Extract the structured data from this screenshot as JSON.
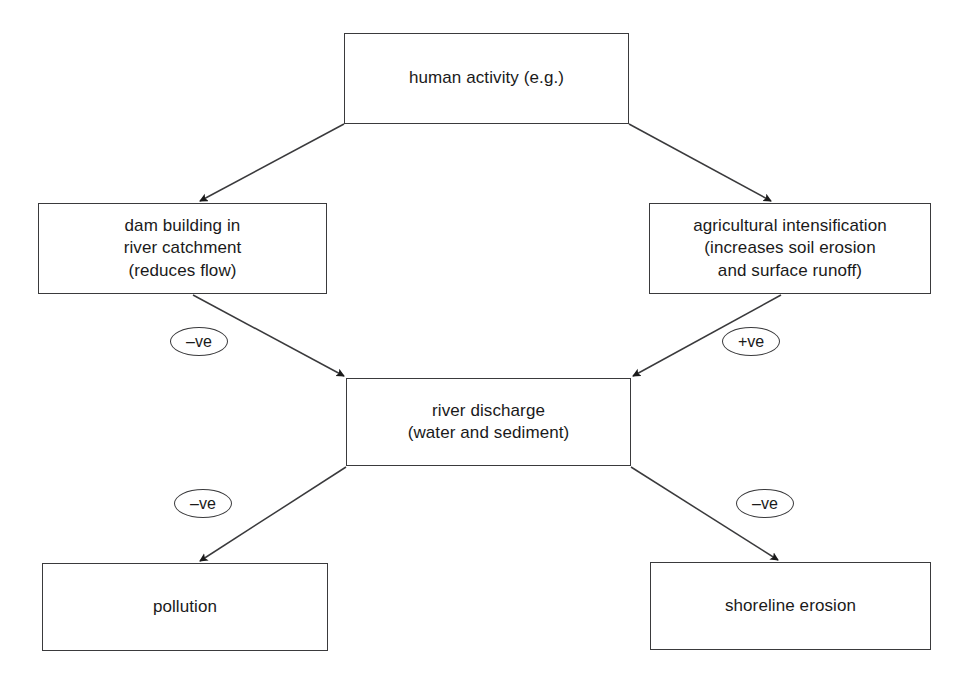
{
  "diagram": {
    "type": "flow-diagram",
    "canvas": {
      "width": 979,
      "height": 679,
      "background": "#ffffff"
    },
    "stroke_color": "#3a3a3c",
    "text_color": "#1a1a1a",
    "nodes": [
      {
        "id": "human-activity",
        "label": "human activity (e.g.)",
        "x": 344,
        "y": 33,
        "width": 285,
        "height": 91
      },
      {
        "id": "dam-building",
        "label": "dam building in\nriver catchment\n(reduces flow)",
        "x": 38,
        "y": 203,
        "width": 289,
        "height": 91
      },
      {
        "id": "agricultural-intensification",
        "label": "agricultural intensification\n(increases soil erosion\nand surface runoff)",
        "x": 649,
        "y": 203,
        "width": 282,
        "height": 91
      },
      {
        "id": "river-discharge",
        "label": "river discharge\n(water and sediment)",
        "x": 346,
        "y": 378,
        "width": 285,
        "height": 88
      },
      {
        "id": "pollution",
        "label": "pollution",
        "x": 42,
        "y": 563,
        "width": 286,
        "height": 88
      },
      {
        "id": "shoreline-erosion",
        "label": "shoreline erosion",
        "x": 650,
        "y": 562,
        "width": 281,
        "height": 88
      }
    ],
    "edges": [
      {
        "id": "human-to-dam",
        "from": "human-activity",
        "to": "dam-building",
        "sign": "",
        "path": {
          "x1": 344,
          "y1": 124,
          "x2": 200,
          "y2": 201
        }
      },
      {
        "id": "human-to-agriculture",
        "from": "human-activity",
        "to": "agricultural-intensification",
        "sign": "",
        "path": {
          "x1": 629,
          "y1": 124,
          "x2": 771,
          "y2": 201
        }
      },
      {
        "id": "dam-to-discharge",
        "from": "dam-building",
        "to": "river-discharge",
        "sign": "–ve",
        "path": {
          "x1": 193,
          "y1": 295,
          "x2": 344,
          "y2": 376
        }
      },
      {
        "id": "agriculture-to-discharge",
        "from": "agricultural-intensification",
        "to": "river-discharge",
        "sign": "+ve",
        "path": {
          "x1": 781,
          "y1": 295,
          "x2": 633,
          "y2": 376
        }
      },
      {
        "id": "discharge-to-pollution",
        "from": "river-discharge",
        "to": "pollution",
        "sign": "–ve",
        "path": {
          "x1": 346,
          "y1": 467,
          "x2": 200,
          "y2": 561
        }
      },
      {
        "id": "discharge-to-shoreline",
        "from": "river-discharge",
        "to": "shoreline-erosion",
        "sign": "–ve",
        "path": {
          "x1": 631,
          "y1": 467,
          "x2": 778,
          "y2": 560
        }
      }
    ],
    "badges": [
      {
        "id": "badge-dam-to-discharge",
        "label": "–ve",
        "x": 170,
        "y": 327
      },
      {
        "id": "badge-agri-to-discharge",
        "label": "+ve",
        "x": 722,
        "y": 327
      },
      {
        "id": "badge-discharge-pollution",
        "label": "–ve",
        "x": 174,
        "y": 489
      },
      {
        "id": "badge-discharge-shoreline",
        "label": "–ve",
        "x": 736,
        "y": 489
      }
    ]
  }
}
